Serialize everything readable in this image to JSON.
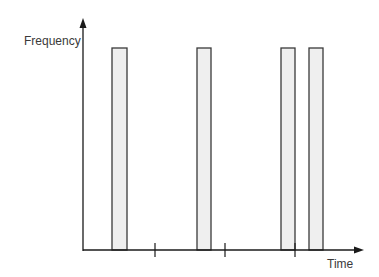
{
  "diagram": {
    "y_axis_label": "Frequency",
    "x_axis_label": "Time",
    "colors": {
      "axis": "#1a1a1a",
      "bar_fill": "#efefef",
      "bar_stroke": "#3a3a3a"
    },
    "bars": [
      {
        "x": 112,
        "width": 15
      },
      {
        "x": 197,
        "width": 14
      },
      {
        "x": 281,
        "width": 14
      },
      {
        "x": 309,
        "width": 14
      }
    ],
    "ticks_x": [
      155,
      225,
      295
    ]
  }
}
